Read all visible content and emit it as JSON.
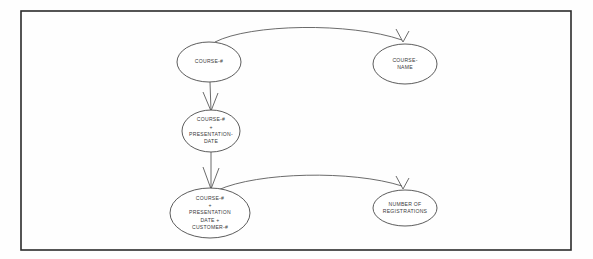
{
  "diagram": {
    "type": "functional-dependency-diagram",
    "frame": {
      "x": 21,
      "y": 11,
      "width": 550,
      "height": 239
    },
    "colors": {
      "background": "#fefefe",
      "frame_stroke": "#2b2b2b",
      "node_stroke": "#4a4a4a",
      "edge_stroke": "#5a5a5a",
      "text": "#3a3a3a"
    },
    "nodes": [
      {
        "id": "course-number",
        "name": "course-number-node",
        "cx": 209,
        "cy": 62,
        "rx": 32,
        "ry": 20,
        "lines": [
          "COURSE-#"
        ]
      },
      {
        "id": "course-name",
        "name": "course-name-node",
        "cx": 405,
        "cy": 64,
        "rx": 32,
        "ry": 20,
        "lines": [
          "COURSE-",
          "NAME"
        ]
      },
      {
        "id": "course-number-presentation-date",
        "name": "course-number-presentation-date-node",
        "cx": 211,
        "cy": 131,
        "rx": 29,
        "ry": 21,
        "lines": [
          "COURSE-#",
          "+",
          "PRESENTATION-",
          "DATE"
        ]
      },
      {
        "id": "course-number-presentation-date-customer-number",
        "name": "course-presentation-customer-node",
        "cx": 210,
        "cy": 213,
        "rx": 40,
        "ry": 25,
        "lines": [
          "COURSE-#",
          "+",
          "PRESENTATION",
          "DATE +",
          "CUSTOMER-#"
        ]
      },
      {
        "id": "number-of-registrations",
        "name": "number-of-registrations-node",
        "cx": 405,
        "cy": 208,
        "rx": 32,
        "ry": 18,
        "lines": [
          "NUMBER OF",
          "REGISTRATIONS"
        ]
      }
    ],
    "edges": [
      {
        "id": "edge-course-number-to-course-name",
        "name": "edge-course-number-to-course-name",
        "from": "course-number",
        "to": "course-name",
        "style": "curved-arc",
        "path": "M 215 42 C 250 24 350 22 402 40",
        "arrow": "M 396 29 L 403 42 M 409 31 L 403 42"
      },
      {
        "id": "edge-course-number-to-presentation-date",
        "name": "edge-course-number-to-presentation-date",
        "from": "course-number",
        "to": "course-number-presentation-date",
        "style": "straight-vertical",
        "path": "M 210 82 L 211 111",
        "arrow": "M 203 92 L 211 111 M 218 93 L 211 111"
      },
      {
        "id": "edge-presentation-date-to-customer",
        "name": "edge-presentation-date-to-customer",
        "from": "course-number-presentation-date",
        "to": "course-number-presentation-date-customer-number",
        "style": "straight-vertical",
        "path": "M 211 152 L 211 189",
        "arrow": "M 203 167 L 211 189 M 219 168 L 211 189"
      },
      {
        "id": "edge-customer-to-registrations",
        "name": "edge-customer-to-registrations",
        "from": "course-number-presentation-date-customer-number",
        "to": "number-of-registrations",
        "style": "curved-arc",
        "path": "M 218 190 C 258 172 352 170 402 186",
        "arrow": "M 396 176 L 403 189 M 409 178 L 403 189"
      }
    ]
  }
}
